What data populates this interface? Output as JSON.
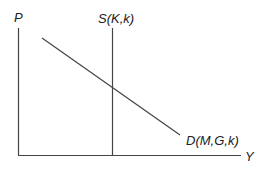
{
  "diagram": {
    "type": "supply-demand",
    "axes": {
      "y_label": "P",
      "x_label": "Y",
      "line_color": "#444444"
    },
    "curves": [
      {
        "name": "supply",
        "label": "S(K,k)",
        "orientation": "vertical"
      },
      {
        "name": "demand",
        "label": "D(M,G,k)",
        "orientation": "downward-sloping"
      }
    ]
  }
}
